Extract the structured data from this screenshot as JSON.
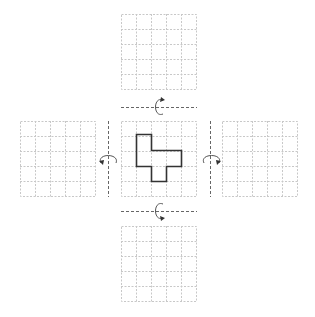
{
  "diagram": {
    "grid_size": 5,
    "colors": {
      "grid_line": "#c8c8c8",
      "shape_outline": "#333333",
      "axis": "#666666",
      "arrow": "#555555"
    },
    "center_shape_cells": [
      [
        1,
        1
      ],
      [
        1,
        2
      ],
      [
        2,
        2
      ],
      [
        3,
        2
      ],
      [
        2,
        3
      ]
    ],
    "grids": [
      {
        "id": "top",
        "empty": true
      },
      {
        "id": "left",
        "empty": true
      },
      {
        "id": "center",
        "empty": false
      },
      {
        "id": "right",
        "empty": true
      },
      {
        "id": "bottom",
        "empty": true
      }
    ],
    "axes": [
      {
        "id": "top",
        "orientation": "horizontal"
      },
      {
        "id": "left",
        "orientation": "vertical"
      },
      {
        "id": "right",
        "orientation": "vertical"
      },
      {
        "id": "bottom",
        "orientation": "horizontal"
      }
    ]
  }
}
